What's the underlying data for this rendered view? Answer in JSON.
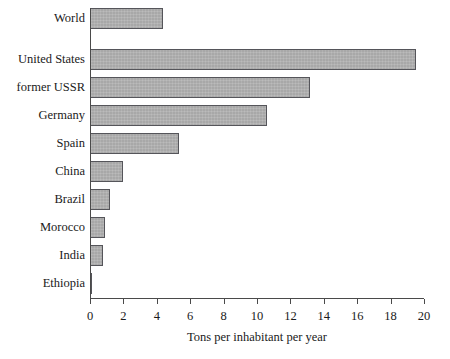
{
  "chart_data": {
    "type": "bar",
    "orientation": "horizontal",
    "title": "",
    "subtitle": "",
    "xlabel": "Tons per inhabitant per year",
    "ylabel": "",
    "categories": [
      "World",
      "United States",
      "former USSR",
      "Germany",
      "Spain",
      "China",
      "Brazil",
      "Morocco",
      "India",
      "Ethiopia"
    ],
    "values": [
      4.4,
      19.5,
      13.2,
      10.6,
      5.3,
      2.0,
      1.2,
      0.9,
      0.8,
      0.1
    ],
    "xlim": [
      0,
      20
    ],
    "xticks": [
      0,
      2,
      4,
      6,
      8,
      10,
      12,
      14,
      16,
      18,
      20
    ],
    "xtick_labels": [
      "0",
      "2",
      "4",
      "6",
      "8",
      "10",
      "12",
      "14",
      "16",
      "18",
      "20"
    ],
    "grid": false,
    "legend": false,
    "legend_position": "none",
    "bar_fill_color": "#a8a8a8",
    "bar_edge_color": "#55555a",
    "axis_color": "#4a4a4a",
    "background_color": "#ffffff",
    "group_gap_after_index": 0
  }
}
